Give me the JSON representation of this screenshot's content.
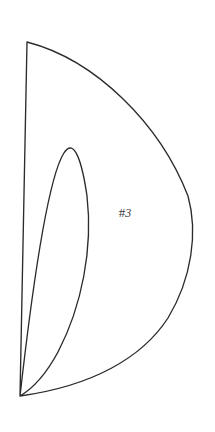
{
  "figure": {
    "kind": "crescent-outline-drawing",
    "label_prefix": "#",
    "label_number": "3",
    "label_full": "#3",
    "background_color": "#ffffff",
    "stroke_color": "#2b2b2d",
    "fill_color": "#ffffff",
    "stroke_width_px": 1.35,
    "canvas": {
      "width": 215,
      "height": 432
    },
    "geometry": {
      "top_cusp": [
        27,
        42
      ],
      "bottom_cusp": [
        20,
        396
      ],
      "outer_arc_extreme": [
        194,
        220
      ],
      "inner_arc_extreme": [
        87,
        215
      ],
      "outer_arc_path": "M 27 42 C 96 60, 160 124, 188 196 C 198 232, 192 278, 168 318 C 142 358, 92 386, 20 396",
      "inner_arc_path": "M 27 42 C 56 78, 78 134, 87 196 C 93 248, 82 306, 58 352 C 45 376, 32 389, 20 396"
    },
    "label_position": [
      125,
      216
    ]
  }
}
